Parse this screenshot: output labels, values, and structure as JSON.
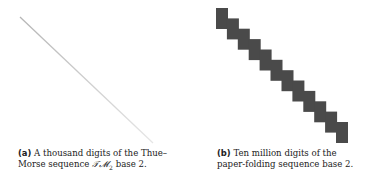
{
  "panels": [
    {
      "id": "a",
      "label": "(a)",
      "caption_part1": "A thousand digits of the Thue–Morse sequence ",
      "math": "𝒯𝓜",
      "math_sub": "2",
      "caption_part2": " base 2.",
      "figure": {
        "type": "line",
        "start": [
          20,
          17
        ],
        "end": [
          153,
          143
        ],
        "color": "#c8c8c8"
      }
    },
    {
      "id": "b",
      "label": "(b)",
      "caption_part1": "Ten million digits of the paper-folding sequence base 2.",
      "figure": {
        "type": "staircase",
        "steps": 12,
        "first_block": [
          216,
          8
        ],
        "last_block": [
          336,
          122
        ],
        "block_width": 12,
        "block_height": 21,
        "color": "#4a4a4a"
      }
    }
  ]
}
